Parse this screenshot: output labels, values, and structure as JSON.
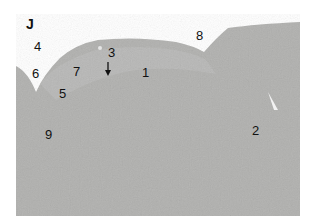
{
  "figure": {
    "panel_letter": "J",
    "labels": [
      {
        "text": "4",
        "x": 34,
        "y": 40
      },
      {
        "text": "6",
        "x": 32,
        "y": 67
      },
      {
        "text": "7",
        "x": 73,
        "y": 65
      },
      {
        "text": "3",
        "x": 108,
        "y": 46
      },
      {
        "text": "1",
        "x": 142,
        "y": 66
      },
      {
        "text": "5",
        "x": 59,
        "y": 87
      },
      {
        "text": "8",
        "x": 196,
        "y": 29
      },
      {
        "text": "9",
        "x": 45,
        "y": 128
      },
      {
        "text": "2",
        "x": 252,
        "y": 124
      }
    ],
    "arrow": {
      "direction": "down",
      "x": 108,
      "y": 62
    },
    "colors": {
      "background": "#ffffff",
      "tissue": "#b0b0ae",
      "tissue_light": "#c4c4c2",
      "label": "#111111"
    }
  }
}
